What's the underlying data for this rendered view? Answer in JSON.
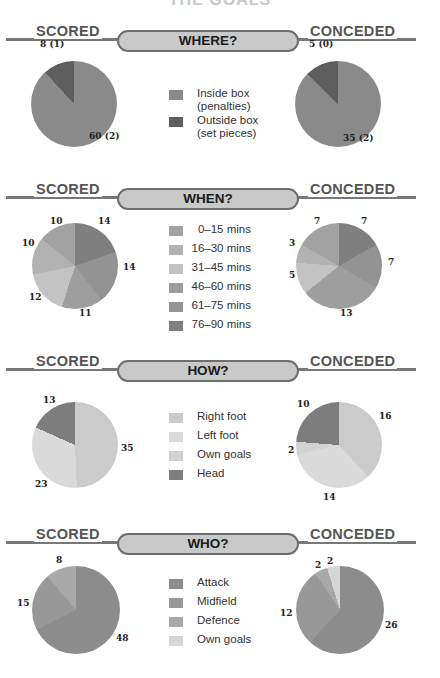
{
  "title": "THE GOALS",
  "labels": {
    "left": "SCORED",
    "right": "CONCEDED"
  },
  "colors": {
    "rule": "#777777",
    "pill_fill": "#c9c9c9",
    "pill_border": "#6e6e6e"
  },
  "sections": [
    {
      "heading": "WHERE?",
      "legend": [
        {
          "label": "Inside box\n(penalties)",
          "color": "#8a8a8a"
        },
        {
          "label": "Outside box\n(set pieces)",
          "color": "#5e5e5e"
        }
      ],
      "scored": {
        "values": [
          60,
          8
        ],
        "labels": [
          "60 (2)",
          "8 (1)"
        ]
      },
      "conceded": {
        "values": [
          35,
          5
        ],
        "labels": [
          "35 (2)",
          "5 (0)"
        ]
      }
    },
    {
      "heading": "WHEN?",
      "legend": [
        {
          "label": "0–15 mins",
          "color": "#a2a2a2"
        },
        {
          "label": "16–30 mins",
          "color": "#b2b2b2"
        },
        {
          "label": "31–45 mins",
          "color": "#c3c3c3"
        },
        {
          "label": "46–60 mins",
          "color": "#9e9e9e"
        },
        {
          "label": "61–75 mins",
          "color": "#939393"
        },
        {
          "label": "76–90 mins",
          "color": "#7f7f7f"
        }
      ],
      "scored": {
        "values": [
          10,
          10,
          12,
          11,
          14,
          14
        ],
        "labels": [
          "10",
          "10",
          "12",
          "11",
          "14",
          "14"
        ]
      },
      "conceded": {
        "values": [
          7,
          3,
          5,
          13,
          7,
          7
        ],
        "labels": [
          "7",
          "3",
          "5",
          "13",
          "7",
          "7"
        ]
      }
    },
    {
      "heading": "HOW?",
      "legend": [
        {
          "label": "Right foot",
          "color": "#cbcbcb"
        },
        {
          "label": "Left foot",
          "color": "#dadada"
        },
        {
          "label": "Own goals",
          "color": "#d2d2d2"
        },
        {
          "label": "Head",
          "color": "#7d7d7d"
        }
      ],
      "scored": {
        "values": [
          35,
          23,
          0,
          13
        ],
        "labels": [
          "35",
          "23",
          "",
          "13"
        ]
      },
      "conceded": {
        "values": [
          16,
          14,
          2,
          10
        ],
        "labels": [
          "16",
          "14",
          "2",
          "10"
        ]
      }
    },
    {
      "heading": "WHO?",
      "legend": [
        {
          "label": "Attack",
          "color": "#8c8c8c"
        },
        {
          "label": "Midfield",
          "color": "#989898"
        },
        {
          "label": "Defence",
          "color": "#a8a8a8"
        },
        {
          "label": "Own goals",
          "color": "#d6d6d6"
        }
      ],
      "scored": {
        "values": [
          48,
          15,
          8,
          0
        ],
        "labels": [
          "48",
          "15",
          "8",
          ""
        ]
      },
      "conceded": {
        "values": [
          26,
          12,
          2,
          2
        ],
        "labels": [
          "26",
          "12",
          "2",
          "2"
        ]
      }
    }
  ],
  "chart_data": [
    {
      "type": "pie",
      "title": "WHERE? — Scored",
      "categories": [
        "Inside box (penalties)",
        "Outside box (set pieces)"
      ],
      "values": [
        60,
        8
      ],
      "annotations": [
        "60 (2)",
        "8 (1)"
      ]
    },
    {
      "type": "pie",
      "title": "WHERE? — Conceded",
      "categories": [
        "Inside box (penalties)",
        "Outside box (set pieces)"
      ],
      "values": [
        35,
        5
      ],
      "annotations": [
        "35 (2)",
        "5 (0)"
      ]
    },
    {
      "type": "pie",
      "title": "WHEN? — Scored",
      "categories": [
        "0–15 mins",
        "16–30 mins",
        "31–45 mins",
        "46–60 mins",
        "61–75 mins",
        "76–90 mins"
      ],
      "values": [
        10,
        10,
        12,
        11,
        14,
        14
      ]
    },
    {
      "type": "pie",
      "title": "WHEN? — Conceded",
      "categories": [
        "0–15 mins",
        "16–30 mins",
        "31–45 mins",
        "46–60 mins",
        "61–75 mins",
        "76–90 mins"
      ],
      "values": [
        7,
        3,
        5,
        13,
        7,
        7
      ]
    },
    {
      "type": "pie",
      "title": "HOW? — Scored",
      "categories": [
        "Right foot",
        "Left foot",
        "Own goals",
        "Head"
      ],
      "values": [
        35,
        23,
        0,
        13
      ]
    },
    {
      "type": "pie",
      "title": "HOW? — Conceded",
      "categories": [
        "Right foot",
        "Left foot",
        "Own goals",
        "Head"
      ],
      "values": [
        16,
        14,
        2,
        10
      ]
    },
    {
      "type": "pie",
      "title": "WHO? — Scored",
      "categories": [
        "Attack",
        "Midfield",
        "Defence",
        "Own goals"
      ],
      "values": [
        48,
        15,
        8,
        0
      ]
    },
    {
      "type": "pie",
      "title": "WHO? — Conceded",
      "categories": [
        "Attack",
        "Midfield",
        "Defence",
        "Own goals"
      ],
      "values": [
        26,
        12,
        2,
        2
      ]
    }
  ]
}
